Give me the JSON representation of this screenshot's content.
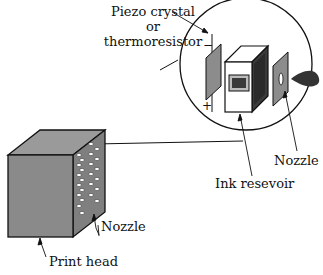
{
  "labels": {
    "piezo_line1": "Piezo crystal",
    "piezo_line2": "or",
    "piezo_line3": "thermoresistor",
    "nozzle_inset": "Nozzle",
    "ink_reservoir": "Ink resevoir",
    "nozzle_head": "Nozzle",
    "print_head": "Print head",
    "minus": "−",
    "plus": "+"
  },
  "colors": {
    "cube_front": "#8a8a8a",
    "cube_top": "#9a9a9a",
    "cube_side": "#7c7c7c",
    "plate": "#8c8c8c",
    "reservoir_dark": "#3a3a3a",
    "ink_drop": "#333333",
    "line": "#111111"
  }
}
